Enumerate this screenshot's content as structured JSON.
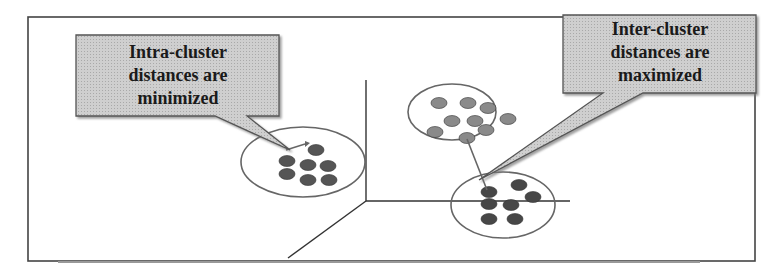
{
  "diagram": {
    "callouts": [
      {
        "id": "intra",
        "lines": [
          "Intra-cluster",
          "distances are",
          "minimized"
        ]
      },
      {
        "id": "inter",
        "lines": [
          "Inter-cluster",
          "distances are",
          "maximized"
        ]
      }
    ],
    "colors": {
      "frame": "#444444",
      "callout_fill": "#c8c8c8",
      "callout_border": "#555555",
      "axis": "#333333",
      "ellipse": "#666666",
      "cluster_left_points": "#555555",
      "cluster_top_right_points": "#8a8a8a",
      "cluster_bottom_right_points": "#474747"
    },
    "clusters": [
      {
        "name": "left-cluster",
        "ellipse": {
          "cx": 303,
          "cy": 162,
          "rx": 62,
          "ry": 35
        },
        "points": [
          [
            316,
            150
          ],
          [
            287,
            161
          ],
          [
            308,
            165
          ],
          [
            328,
            166
          ],
          [
            287,
            174
          ],
          [
            308,
            180
          ],
          [
            329,
            180
          ]
        ]
      },
      {
        "name": "top-right-cluster",
        "ellipse": {
          "cx": 452,
          "cy": 112,
          "rx": 44,
          "ry": 28
        },
        "points": [
          [
            439,
            103
          ],
          [
            468,
            103
          ],
          [
            488,
            108
          ],
          [
            452,
            121
          ],
          [
            475,
            121
          ],
          [
            508,
            119
          ],
          [
            435,
            132
          ],
          [
            486,
            130
          ],
          [
            467,
            138
          ]
        ]
      },
      {
        "name": "bottom-right-cluster",
        "ellipse": {
          "cx": 503,
          "cy": 205,
          "rx": 52,
          "ry": 33
        },
        "points": [
          [
            489,
            192
          ],
          [
            519,
            185
          ],
          [
            533,
            197
          ],
          [
            489,
            204
          ],
          [
            511,
            205
          ],
          [
            489,
            219
          ],
          [
            515,
            219
          ]
        ]
      }
    ]
  }
}
